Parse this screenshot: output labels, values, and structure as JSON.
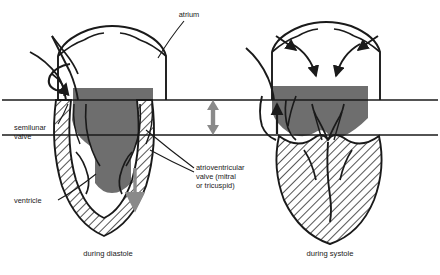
{
  "figure": {
    "background_color": "#ffffff",
    "ink_color": "#1a1a1a",
    "blood_fill_color": "#6e6e6e",
    "muscle_hatch_color": "#1a1a1a",
    "arrow_grey_color": "#8a8a8a"
  },
  "labels": {
    "atrium": "atrium",
    "semilunar_valve": "semilunar\nvalve",
    "semilunar_valve_line1": "semilunar",
    "semilunar_valve_line2": "valve",
    "ventricle": "ventricle",
    "av_valve_line1": "atrioventricular",
    "av_valve_line2": "valve (mitral",
    "av_valve_line3": "or tricuspid)"
  },
  "panels": [
    {
      "id": "left-panel",
      "caption": "during diastole",
      "phase": "diastole",
      "description": "Ventricle relaxed and filling; atrioventricular valve open, semilunar valve closed.",
      "blood_column": "atrium into ventricle",
      "flow_arrow_direction": "down",
      "flow_arrow_color": "#8a8a8a",
      "semilunar_arrow": "recirculating curl at closed semilunar valve",
      "semilunar_arrow_color": "#1a1a1a"
    },
    {
      "id": "right-panel",
      "caption": "during systole",
      "phase": "systole",
      "description": "Ventricle contracted and ejecting; atrioventricular valve closed, semilunar valve open, atrium refilling.",
      "blood_column": "atrium filling above closed AV valve",
      "flow_arrow_direction": "up",
      "flow_arrow_color": "#1a1a1a",
      "inflow_arrows": 4,
      "inflow_arrow_color": "#1a1a1a"
    }
  ],
  "reference_lines": {
    "upper_line_label": "upper reference level",
    "lower_line_label": "lower reference level",
    "count": 2
  },
  "plane_arrow": {
    "name": "av-plane-excursion-arrow",
    "kind": "double-headed vertical arrow",
    "color": "#8a8a8a",
    "meaning": "descent of the atrioventricular plane between diastole and systole"
  }
}
